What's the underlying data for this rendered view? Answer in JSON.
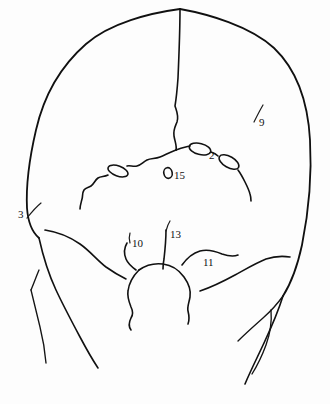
{
  "figure": {
    "view": "posterior",
    "background_color": "#fdfdfd",
    "stroke_color": "#111111"
  },
  "labels": [
    {
      "id": "label-3",
      "text": "3",
      "x": 18,
      "y": 209,
      "leader": true
    },
    {
      "id": "label-9",
      "text": "9",
      "x": 259,
      "y": 117,
      "leader": true
    },
    {
      "id": "label-2",
      "text": "2",
      "x": 209,
      "y": 150,
      "leader": false
    },
    {
      "id": "label-15",
      "text": "15",
      "x": 174,
      "y": 170,
      "leader": false
    },
    {
      "id": "label-10",
      "text": "10",
      "x": 132,
      "y": 238,
      "leader": true
    },
    {
      "id": "label-13",
      "text": "13",
      "x": 170,
      "y": 229,
      "leader": true
    },
    {
      "id": "label-11",
      "text": "11",
      "x": 203,
      "y": 257,
      "leader": false
    }
  ],
  "features": {
    "cranial_outline": "skull vault outline, posterior aspect",
    "sagittal_suture": "midline suture from vertex to lambda",
    "lambdoid_suture_left": "wavy suture descending to the left",
    "lambdoid_suture_right": "wavy suture descending to the right",
    "wormian_bone_left": "lens-shaped sutural bone on left lambdoid suture",
    "wormian_bone_right_upper": "lens-shaped sutural bone on right lambdoid suture",
    "wormian_bone_right_lower": "second lens-shaped sutural bone on right lambdoid suture",
    "small_foramen": "small oval foramen near midline labelled 15",
    "foramen_magnum": "large central opening at skull base",
    "occipital_condyle_left": "left inferior margin line",
    "occipital_condyle_right": "right inferior margin line",
    "mastoid_left": "left mastoid / temporal outline",
    "mastoid_right": "right mastoid / temporal outline"
  }
}
